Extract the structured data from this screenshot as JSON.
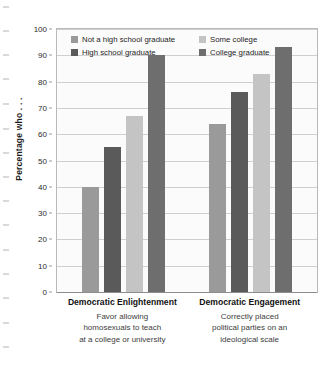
{
  "chart_data": {
    "type": "bar",
    "title": "",
    "xlabel": "",
    "ylabel": "Percentage who . . .",
    "ylim": [
      0,
      100
    ],
    "ytick_step": 10,
    "yticks": [
      100,
      90,
      80,
      70,
      60,
      50,
      40,
      30,
      20,
      10,
      0
    ],
    "grid": true,
    "legend_position": "inside-top",
    "categories": [
      "Democratic Enlightenment",
      "Democratic Engagement"
    ],
    "category_subtitles": [
      [
        "Favor allowing",
        "homosexuals to teach",
        "at a college or university"
      ],
      [
        "Correctly placed",
        "political parties on an",
        "ideological scale"
      ]
    ],
    "series": [
      {
        "name": "Not a high school graduate",
        "color": "#9a9a9a",
        "values": [
          40,
          64
        ]
      },
      {
        "name": "High school graduate",
        "color": "#5a5a5a",
        "values": [
          55,
          76
        ]
      },
      {
        "name": "Some college",
        "color": "#c4c4c4",
        "values": [
          67,
          83
        ]
      },
      {
        "name": "College graduate",
        "color": "#6e6e6e",
        "values": [
          90,
          93
        ]
      }
    ]
  },
  "legend": {
    "entries": [
      {
        "label": "Not a high school graduate",
        "color": "#9a9a9a"
      },
      {
        "label": "Some college",
        "color": "#c4c4c4"
      },
      {
        "label": "High school graduate",
        "color": "#5a5a5a"
      },
      {
        "label": "College graduate",
        "color": "#6e6e6e"
      }
    ]
  },
  "axis": {
    "y_title": "Percentage who . . ."
  },
  "style": {
    "plot_background": "#fbfbfb",
    "grid_color": "#cfcfcf",
    "axis_color": "#8d8d8d",
    "text_color": "#1f1f1f"
  }
}
